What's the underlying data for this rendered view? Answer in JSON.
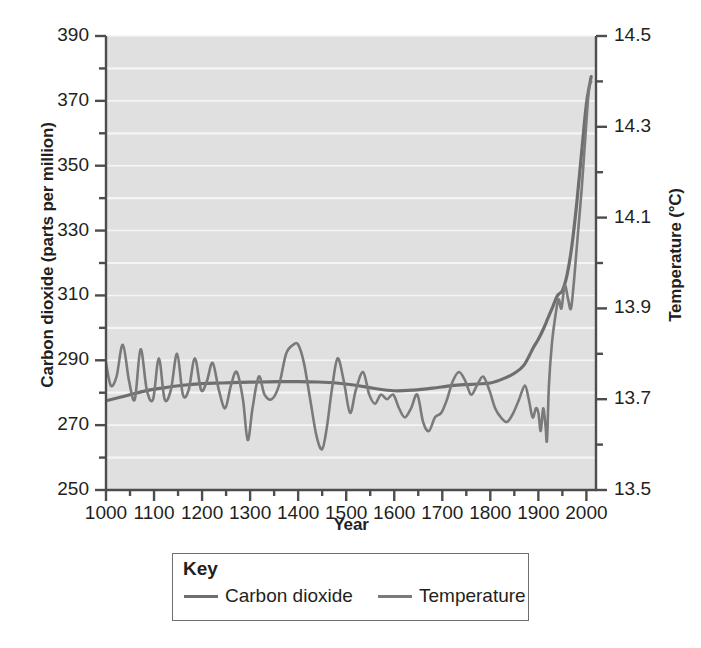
{
  "chart_data": {
    "type": "line",
    "title": "",
    "xlabel": "Year",
    "ylabel": "Carbon dioxide (parts per million)",
    "y2label": "Temperature (°C)",
    "xlim": [
      1000,
      2020
    ],
    "ylim": [
      250,
      390
    ],
    "y2lim": [
      13.5,
      14.5
    ],
    "grid": true,
    "gridlines": "horizontal-white",
    "legend": {
      "position": "below-plot",
      "title": "Key",
      "entries": [
        "Carbon dioxide",
        "Temperature"
      ]
    },
    "xticks": [
      1000,
      1100,
      1200,
      1300,
      1400,
      1500,
      1600,
      1700,
      1800,
      1900,
      2000
    ],
    "xtick_labels": [
      "1000",
      "1100",
      "1200",
      "1300",
      "1400",
      "1500",
      "1600",
      "1700",
      "1800",
      "1900",
      "2000"
    ],
    "xtick_minor_step": 50,
    "yticks": [
      250,
      270,
      290,
      310,
      330,
      350,
      370,
      390
    ],
    "ytick_labels": [
      "250",
      "270",
      "290",
      "310",
      "330",
      "350",
      "370",
      "390"
    ],
    "ytick_minor_step": 10,
    "y2ticks": [
      13.5,
      13.7,
      13.9,
      14.1,
      14.3,
      14.5
    ],
    "y2tick_labels": [
      "13.5",
      "13.7",
      "13.9",
      "14.1",
      "14.3",
      "14.5"
    ],
    "y2tick_minor_step": 0.1,
    "series": [
      {
        "name": "Carbon dioxide",
        "axis": "left",
        "units": "parts per million",
        "color": "#6e6e6e",
        "width": 3.2,
        "x": [
          1000,
          1040,
          1080,
          1120,
          1160,
          1200,
          1240,
          1280,
          1320,
          1360,
          1400,
          1440,
          1480,
          1520,
          1560,
          1600,
          1640,
          1680,
          1720,
          1760,
          1800,
          1830,
          1850,
          1870,
          1890,
          1900,
          1910,
          1920,
          1930,
          1940,
          1950,
          1960,
          1970,
          1980,
          1990,
          2000,
          2010
        ],
        "y": [
          277.5,
          279.0,
          280.5,
          281.5,
          282.3,
          282.8,
          283.0,
          283.2,
          283.3,
          283.4,
          283.4,
          283.3,
          283.0,
          282.3,
          281.3,
          280.6,
          280.8,
          281.4,
          282.2,
          282.6,
          283.0,
          284.5,
          286.0,
          288.5,
          294.0,
          296.5,
          299.5,
          303.0,
          306.5,
          310.0,
          311.5,
          316.5,
          325.5,
          338.5,
          354.0,
          369.0,
          377.5
        ]
      },
      {
        "name": "Temperature",
        "axis": "right",
        "units": "°C",
        "color": "#7a7a7a",
        "width": 2.6,
        "x": [
          1000,
          1010,
          1022,
          1035,
          1048,
          1060,
          1072,
          1085,
          1098,
          1110,
          1122,
          1135,
          1148,
          1160,
          1172,
          1185,
          1198,
          1210,
          1222,
          1235,
          1248,
          1260,
          1272,
          1285,
          1295,
          1305,
          1318,
          1330,
          1345,
          1360,
          1375,
          1390,
          1400,
          1412,
          1425,
          1438,
          1450,
          1460,
          1470,
          1482,
          1495,
          1508,
          1520,
          1535,
          1548,
          1560,
          1572,
          1585,
          1598,
          1610,
          1622,
          1635,
          1648,
          1660,
          1672,
          1685,
          1698,
          1710,
          1722,
          1735,
          1748,
          1760,
          1772,
          1785,
          1798,
          1810,
          1822,
          1835,
          1848,
          1860,
          1872,
          1880,
          1888,
          1895,
          1900,
          1905,
          1910,
          1915,
          1918,
          1922,
          1928,
          1935,
          1942,
          1948,
          1955,
          1962,
          1968,
          1975,
          1982,
          1990,
          1998,
          2005,
          2010
        ],
        "y": [
          13.78,
          13.73,
          13.75,
          13.82,
          13.74,
          13.7,
          13.81,
          13.72,
          13.7,
          13.79,
          13.7,
          13.72,
          13.8,
          13.71,
          13.72,
          13.79,
          13.72,
          13.74,
          13.78,
          13.72,
          13.68,
          13.73,
          13.76,
          13.7,
          13.61,
          13.68,
          13.75,
          13.71,
          13.7,
          13.73,
          13.8,
          13.82,
          13.82,
          13.78,
          13.7,
          13.62,
          13.59,
          13.64,
          13.72,
          13.79,
          13.74,
          13.67,
          13.72,
          13.76,
          13.71,
          13.69,
          13.71,
          13.7,
          13.71,
          13.68,
          13.66,
          13.68,
          13.71,
          13.65,
          13.63,
          13.66,
          13.67,
          13.7,
          13.74,
          13.76,
          13.74,
          13.71,
          13.73,
          13.75,
          13.72,
          13.68,
          13.66,
          13.65,
          13.67,
          13.7,
          13.73,
          13.7,
          13.66,
          13.68,
          13.67,
          13.63,
          13.68,
          13.64,
          13.61,
          13.73,
          13.82,
          13.88,
          13.92,
          13.9,
          13.95,
          13.92,
          13.9,
          13.97,
          14.06,
          14.16,
          14.28,
          14.38,
          14.4
        ]
      }
    ]
  },
  "colors": {
    "plot_background": "#e0e0e0",
    "gridline": "#f5f5f5",
    "axis": "#4d4d4d",
    "text": "#231f20",
    "legend_border": "#6f6f6f",
    "co2_line": "#6e6e6e",
    "temperature_line": "#7a7a7a"
  }
}
